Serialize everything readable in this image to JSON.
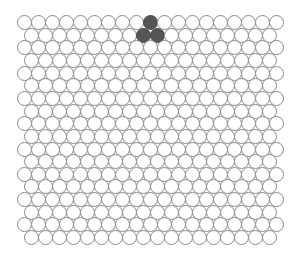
{
  "board": {
    "rows": 18,
    "cols_even_row": 19,
    "cols_odd_row": 18,
    "layout": "hex-offset",
    "origin_x": 17,
    "origin_y": 15,
    "pitch_x": 14,
    "pitch_y": 12.65,
    "odd_row_offset_x": 7,
    "cell_color": "#ffffff",
    "filled_color": "#555555",
    "border_color": "#8a8a8a",
    "filled_cells": [
      {
        "row": 0,
        "col": 9
      },
      {
        "row": 1,
        "col": 8
      },
      {
        "row": 1,
        "col": 9
      }
    ]
  }
}
